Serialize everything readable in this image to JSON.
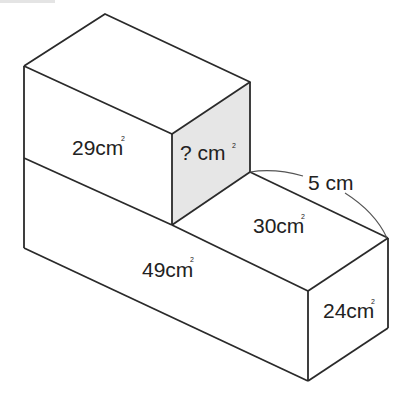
{
  "diagram": {
    "type": "3d-solid-surface-areas",
    "colors": {
      "edge": "#2a2a2a",
      "shaded_face": "#e6e6e6",
      "background": "#ffffff"
    },
    "labels": {
      "top_front": "29cm",
      "unknown_face": "? cm",
      "top_step": "30cm",
      "bottom_front": "49cm",
      "right_end": "24cm",
      "length": "5 cm"
    },
    "unit_superscript": "2"
  }
}
